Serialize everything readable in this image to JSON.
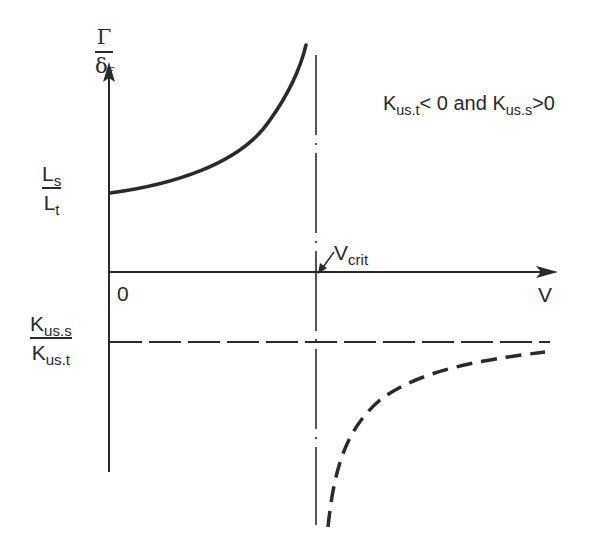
{
  "diagram": {
    "y_axis": {
      "label_numerator": "Γ",
      "label_denominator_main": "δ",
      "label_denominator_sub": "f"
    },
    "x_axis": {
      "label": "V",
      "origin_label": "0"
    },
    "asymptote": {
      "label_main": "V",
      "label_sub": "crit"
    },
    "intercept_label": {
      "num_main": "L",
      "num_sub": "s",
      "den_main": "L",
      "den_sub": "t"
    },
    "horizontal_asymptote_label": {
      "num_main": "K",
      "num_sub": "us.s",
      "den_main": "K",
      "den_sub": "us.t"
    },
    "condition": {
      "k1_main": "K",
      "k1_sub": "us.t",
      "op1": "< 0 and ",
      "k2_main": "K",
      "k2_sub": "us.s",
      "op2": ">0"
    },
    "colors": {
      "ink": "#2a2a2a",
      "background": "#ffffff"
    }
  }
}
